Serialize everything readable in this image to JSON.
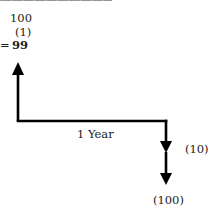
{
  "figure": {
    "cutoff_text": "————————————————————",
    "calculation": {
      "line1": "100",
      "line2": "(1)",
      "equals": "=",
      "result": "99"
    },
    "timeline": {
      "period_label": "1 Year",
      "inflow_arrow": "up",
      "outflows": [
        {
          "label": "(10)"
        },
        {
          "label": "(100)"
        }
      ]
    },
    "colors": {
      "line": "#000000",
      "text": "#1a1a1a",
      "background": "#ffffff"
    }
  }
}
